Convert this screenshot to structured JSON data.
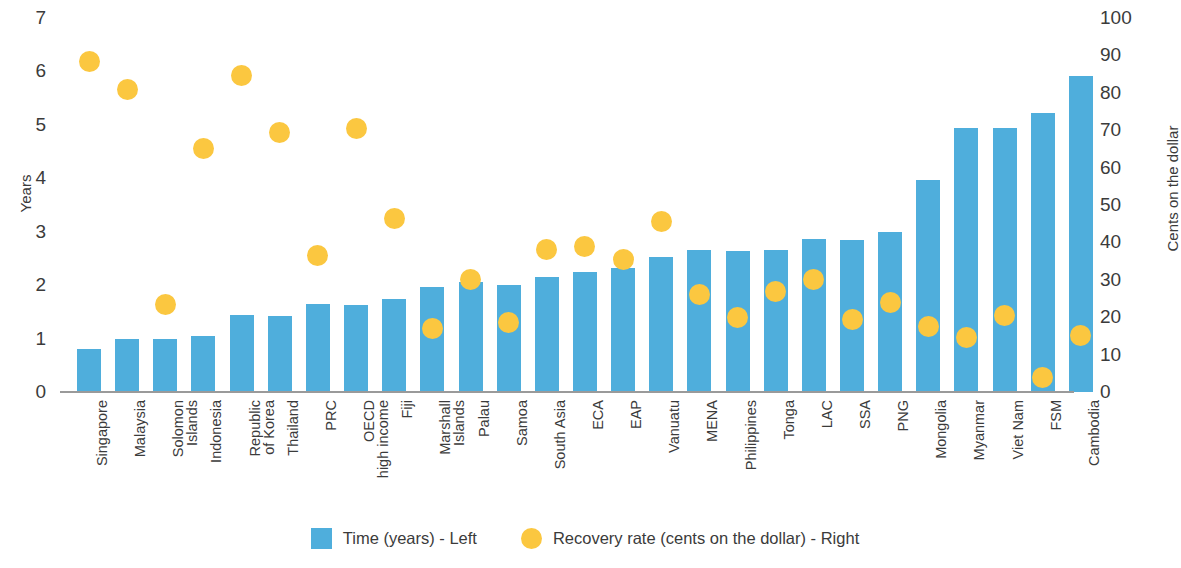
{
  "chart_data": {
    "type": "bar",
    "title": "",
    "subtitle": "",
    "xlabel": "",
    "ylabel": "Years",
    "y2label": "Cents on the dollar",
    "ylim": [
      0,
      7
    ],
    "y2lim": [
      0,
      100
    ],
    "yticks": [
      "7",
      "6",
      "5",
      "4",
      "3",
      "2",
      "1",
      "0"
    ],
    "y2ticks": [
      "100",
      "90",
      "80",
      "70",
      "60",
      "50",
      "40",
      "30",
      "20",
      "10",
      "0"
    ],
    "grid": false,
    "legend_position": "bottom",
    "categories": [
      "Singapore",
      "Malaysia",
      "Solomon\nIslands",
      "Indonesia",
      "Republic\nof Korea",
      "Thailand",
      "PRC",
      "OECD\nhigh income",
      "Fiji",
      "Marshall\nIslands",
      "Palau",
      "Samoa",
      "South Asia",
      "ECA",
      "EAP",
      "Vanuatu",
      "MENA",
      "Philippines",
      "Tonga",
      "LAC",
      "SSA",
      "PNG",
      "Mongolia",
      "Myanmar",
      "Viet Nam",
      "FSM",
      "Cambodia"
    ],
    "series": [
      {
        "name": "Time (years) - Left",
        "type": "bar",
        "axis": "left",
        "color": "#4FAEDC",
        "values": [
          0.8,
          1.0,
          1.0,
          1.05,
          1.45,
          1.43,
          1.65,
          1.62,
          1.75,
          1.97,
          2.05,
          2.0,
          2.15,
          2.25,
          2.33,
          2.53,
          2.65,
          2.63,
          2.65,
          2.87,
          2.84,
          3.0,
          3.97,
          4.95,
          4.95,
          5.23,
          5.92
        ]
      },
      {
        "name": "Recovery rate (cents on the dollar) - Right",
        "type": "scatter",
        "axis": "right",
        "color": "#FBC740",
        "values": [
          88.5,
          81.0,
          23.5,
          65.0,
          84.5,
          69.5,
          36.5,
          70.5,
          46.5,
          17.0,
          30.0,
          18.5,
          38.0,
          39.0,
          35.5,
          45.5,
          26.0,
          20.0,
          27.0,
          30.0,
          19.5,
          24.0,
          17.5,
          14.5,
          20.5,
          4.0,
          15.0
        ]
      }
    ],
    "legend": [
      {
        "label": "Time (years) - Left",
        "marker": "square",
        "color": "#4FAEDC"
      },
      {
        "label": "Recovery rate (cents on the dollar) - Right",
        "marker": "circle",
        "color": "#FBC740"
      }
    ]
  }
}
